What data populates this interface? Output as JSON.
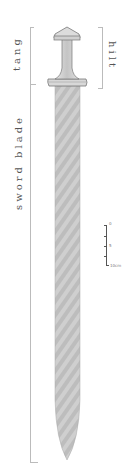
{
  "labels": {
    "tang": "tang",
    "hilt": "hilt",
    "sword_blade": "sword blade"
  },
  "scale_bar": {
    "ticks": [
      "0",
      "5",
      "10cm"
    ]
  },
  "colors": {
    "blade": "#c8c8c8",
    "hilt": "#d4d4d4",
    "outline": "#777777",
    "bracket": "#bbbbbb",
    "text": "#555555"
  }
}
